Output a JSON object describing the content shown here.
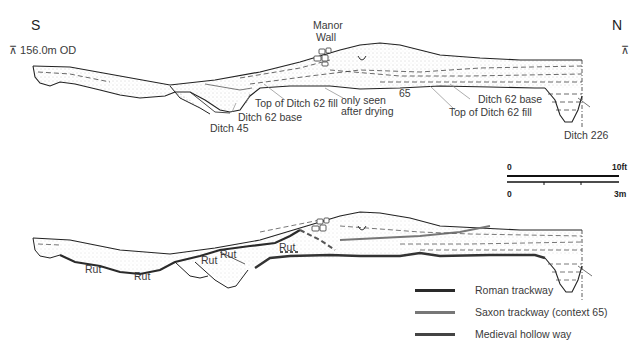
{
  "orientation": {
    "south": "S",
    "north": "N"
  },
  "datum": {
    "symbol": "⊼",
    "label": "156.0m OD"
  },
  "upper_section": {
    "labels": {
      "manor_wall_1": "Manor",
      "manor_wall_2": "Wall",
      "top_ditch62_fill_left": "Top of Ditch 62 fill",
      "ditch62_base_left": "Ditch 62 base",
      "ditch45": "Ditch 45",
      "only_seen": "only seen",
      "after_drying": "after drying",
      "context65": "65",
      "ditch62_base_right": "Ditch 62 base",
      "top_ditch62_fill_right": "Top of Ditch 62 fill",
      "ditch226": "Ditch 226"
    }
  },
  "scale_bar": {
    "imperial_start": "0",
    "imperial_end": "10ft",
    "metric_start": "0",
    "metric_end": "3m"
  },
  "lower_section": {
    "rut_labels": [
      "Rut",
      "Rut",
      "Rut",
      "Rut",
      "Rut"
    ]
  },
  "legend": {
    "items": [
      {
        "label": "Roman trackway",
        "color": "#2a2a2a"
      },
      {
        "label": "Saxon trackway (context 65)",
        "color": "#777777"
      },
      {
        "label": "Medieval hollow way",
        "color": "#444444"
      }
    ]
  }
}
